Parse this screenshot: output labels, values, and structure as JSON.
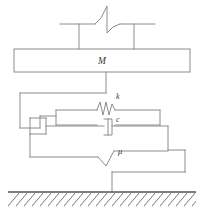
{
  "figure": {
    "labels": {
      "mass": "M",
      "spring": "k",
      "damper": "c",
      "friction": "μ"
    },
    "colors": {
      "line": "#8c8c8c",
      "line_dark": "#6f6f6f",
      "text": "#3a3a3a",
      "ground": "#555555",
      "background": "#ffffff"
    },
    "elements": [
      {
        "name": "ceiling-support",
        "label": ""
      },
      {
        "name": "break-symbol",
        "label": ""
      },
      {
        "name": "mass-block",
        "label": "M"
      },
      {
        "name": "spring-element",
        "label": "k"
      },
      {
        "name": "damper-element",
        "label": "c"
      },
      {
        "name": "friction-element",
        "label": "μ"
      },
      {
        "name": "ground-hatching",
        "label": ""
      }
    ]
  }
}
